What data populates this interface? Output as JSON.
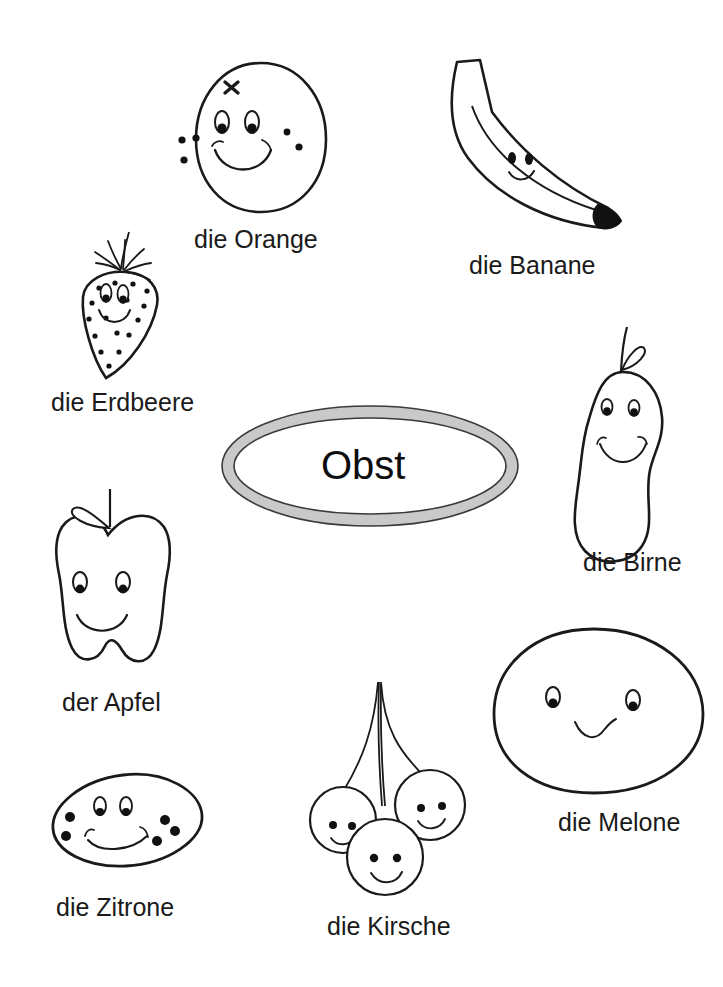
{
  "worksheet": {
    "topic_label": "Obst",
    "language": "German",
    "background_color": "#ffffff",
    "ink_color": "#1a1a1a",
    "ring_fill_color": "#c9c9c9"
  },
  "center": {
    "name": "obst-oval",
    "text": "Obst"
  },
  "items": [
    {
      "id": "orange",
      "label": "die Orange",
      "article": "die",
      "noun": "Orange",
      "shape": "round-fruit-with-freckles",
      "face": "smile",
      "label_x": 194,
      "label_y": 225
    },
    {
      "id": "banane",
      "label": "die Banane",
      "article": "die",
      "noun": "Banane",
      "shape": "curved-banana-with-black-tip",
      "face": "smile",
      "label_x": 469,
      "label_y": 251
    },
    {
      "id": "erdbeere",
      "label": "die Erdbeere",
      "article": "die",
      "noun": "Erdbeere",
      "shape": "cone-strawberry-with-seeds-and-leaves",
      "face": "smile",
      "label_x": 51,
      "label_y": 388
    },
    {
      "id": "birne",
      "label": "die Birne",
      "article": "die",
      "noun": "Birne",
      "shape": "pear-with-stem-and-leaf",
      "face": "smile",
      "label_x": 583,
      "label_y": 548
    },
    {
      "id": "apfel",
      "label": "der Apfel",
      "article": "der",
      "noun": "Apfel",
      "shape": "apple-with-stem-and-leaf",
      "face": "smile",
      "label_x": 62,
      "label_y": 688
    },
    {
      "id": "melone",
      "label": "die Melone",
      "article": "die",
      "noun": "Melone",
      "shape": "large-oval-melon",
      "face": "wavy-smile",
      "label_x": 558,
      "label_y": 808
    },
    {
      "id": "zitrone",
      "label": "die Zitrone",
      "article": "die",
      "noun": "Zitrone",
      "shape": "tilted-oval-lemon-with-dots",
      "face": "smile",
      "label_x": 56,
      "label_y": 893
    },
    {
      "id": "kirsche",
      "label": "die Kirsche",
      "article": "die",
      "noun": "Kirsche",
      "shape": "three-cherries-with-stems",
      "face": "smile",
      "label_x": 327,
      "label_y": 912
    }
  ]
}
